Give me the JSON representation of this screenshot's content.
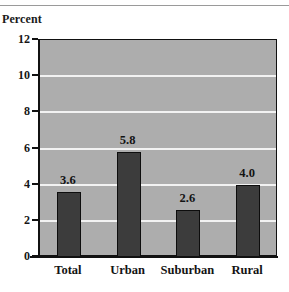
{
  "figure": {
    "axis_title": "Percent",
    "background_color": "#ffffff",
    "plot_background_color": "#adadad",
    "gridline_color": "#f2f2f2",
    "bar_color": "#3c3c3c",
    "bar_border_color": "#0d0d0d",
    "axis_color": "#111111",
    "text_color": "#131313"
  },
  "chart_data": {
    "type": "bar",
    "title": "",
    "subtitle": "",
    "xlabel": "",
    "ylabel": "Percent",
    "categories": [
      "Total",
      "Urban",
      "Suburban",
      "Rural"
    ],
    "values": [
      3.6,
      5.8,
      2.6,
      4.0
    ],
    "value_labels": [
      "3.6",
      "5.8",
      "2.6",
      "4.0"
    ],
    "ylim": [
      0,
      12
    ],
    "ytick_values": [
      0,
      2,
      4,
      6,
      8,
      10,
      12
    ],
    "ytick_labels": [
      "0",
      "2",
      "4",
      "6",
      "8",
      "10",
      "12"
    ],
    "grid": true,
    "grid_axis": "y",
    "legend": false,
    "legend_position": "none",
    "series": [
      {
        "name": "Percent",
        "values": [
          3.6,
          5.8,
          2.6,
          4.0
        ]
      }
    ]
  }
}
